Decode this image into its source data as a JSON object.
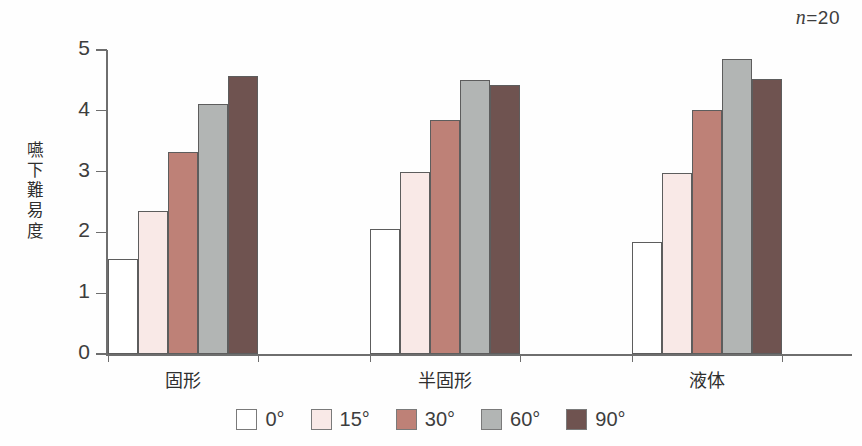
{
  "annotation": {
    "n_label_italic": "n",
    "n_label_rest": "=20"
  },
  "chart_data": {
    "type": "bar",
    "title": "",
    "subtitle": "",
    "xlabel": "",
    "ylabel": "嚥下難易度",
    "ylabel_chars": [
      "嚥",
      "下",
      "難",
      "易",
      "度"
    ],
    "ylim": [
      0,
      5
    ],
    "yticks": [
      0,
      1,
      2,
      3,
      4,
      5
    ],
    "ytick_labels": [
      "0",
      "1",
      "2",
      "3",
      "4",
      "5"
    ],
    "grid": false,
    "legend_position": "bottom-center",
    "annotations": [
      "n=20"
    ],
    "categories": [
      "固形",
      "半固形",
      "液体"
    ],
    "series": [
      {
        "name": "0°",
        "color": "#ffffff",
        "values": [
          1.56,
          2.05,
          1.84
        ]
      },
      {
        "name": "15°",
        "color": "#f9e9e7",
        "values": [
          2.35,
          3.0,
          2.97
        ]
      },
      {
        "name": "30°",
        "color": "#be8177",
        "values": [
          3.32,
          3.85,
          4.02
        ]
      },
      {
        "name": "60°",
        "color": "#b2b5b4",
        "values": [
          4.11,
          4.51,
          4.86
        ]
      },
      {
        "name": "90°",
        "color": "#6f5350",
        "values": [
          4.57,
          4.42,
          4.52
        ]
      }
    ]
  },
  "axis_colors": {
    "axis_line": "#6e6e6e",
    "bar_outline": "#5d5d5d",
    "text": "#3d3d3d"
  }
}
